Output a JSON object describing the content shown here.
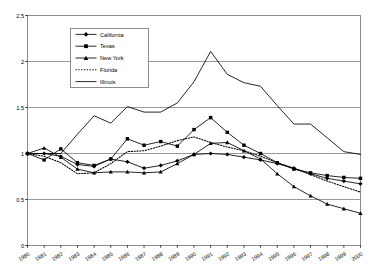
{
  "chart_data": {
    "type": "line",
    "title": "",
    "subtitle": "",
    "xlabel": "",
    "ylabel": "",
    "x": [
      1980,
      1981,
      1982,
      1983,
      1984,
      1985,
      1986,
      1987,
      1988,
      1989,
      1990,
      1991,
      1992,
      1993,
      1994,
      1995,
      1996,
      1997,
      1998,
      1999,
      2000
    ],
    "xtick_labels": [
      "1980",
      "1981",
      "1982",
      "1983",
      "1984",
      "1985",
      "1986",
      "1987",
      "1988",
      "1989",
      "1990",
      "1991",
      "1992",
      "1993",
      "1994",
      "1995",
      "1996",
      "1997",
      "1998",
      "1999",
      "2000"
    ],
    "ytick_labels": [
      "0",
      "0.5",
      "1",
      "1.5",
      "2",
      "2.5"
    ],
    "yticks": [
      0,
      0.5,
      1,
      1.5,
      2,
      2.5
    ],
    "ylim": [
      0,
      2.5
    ],
    "xlim": [
      1980,
      2000
    ],
    "grid": "horizontal",
    "legend_position": "upper-left-inside",
    "series": [
      {
        "name": "California",
        "marker": "diamond",
        "line_style": "solid",
        "color": "#000000",
        "values": [
          1.0,
          1.0,
          0.97,
          0.88,
          0.86,
          0.94,
          0.91,
          0.84,
          0.87,
          0.92,
          0.99,
          1.0,
          0.99,
          0.96,
          0.93,
          0.89,
          0.84,
          0.78,
          0.73,
          0.7,
          0.67
        ]
      },
      {
        "name": "Texas",
        "marker": "square",
        "line_style": "solid",
        "color": "#000000",
        "values": [
          1.0,
          0.93,
          1.05,
          0.9,
          0.87,
          0.94,
          1.16,
          1.09,
          1.13,
          1.08,
          1.26,
          1.39,
          1.23,
          1.09,
          1.0,
          0.9,
          0.83,
          0.79,
          0.76,
          0.74,
          0.73
        ]
      },
      {
        "name": "New York",
        "marker": "triangle",
        "line_style": "solid",
        "color": "#000000",
        "values": [
          1.0,
          1.06,
          0.96,
          0.83,
          0.79,
          0.8,
          0.8,
          0.79,
          0.8,
          0.89,
          0.99,
          1.11,
          1.12,
          1.03,
          0.94,
          0.78,
          0.64,
          0.54,
          0.45,
          0.4,
          0.35
        ]
      },
      {
        "name": "Florida",
        "marker": "none",
        "line_style": "dotted",
        "color": "#000000",
        "values": [
          1.0,
          0.97,
          0.9,
          0.78,
          0.79,
          0.89,
          1.02,
          1.03,
          1.08,
          1.14,
          1.18,
          1.12,
          1.07,
          1.03,
          0.97,
          0.9,
          0.84,
          0.77,
          0.7,
          0.64,
          0.58
        ]
      },
      {
        "name": "Illinois",
        "marker": "none",
        "line_style": "solid",
        "color": "#000000",
        "values": [
          1.0,
          1.0,
          1.0,
          1.21,
          1.41,
          1.33,
          1.51,
          1.45,
          1.45,
          1.55,
          1.78,
          2.11,
          1.86,
          1.77,
          1.73,
          1.52,
          1.32,
          1.32,
          1.17,
          1.02,
          0.99
        ]
      }
    ]
  },
  "legend": {
    "entries": [
      {
        "label": "California"
      },
      {
        "label": "Texas"
      },
      {
        "label": "New York"
      },
      {
        "label": "Florida"
      },
      {
        "label": "Illinois"
      }
    ]
  },
  "colors": {
    "line": "#000000",
    "grid": "#808080",
    "frame": "#808080",
    "background": "#ffffff"
  }
}
